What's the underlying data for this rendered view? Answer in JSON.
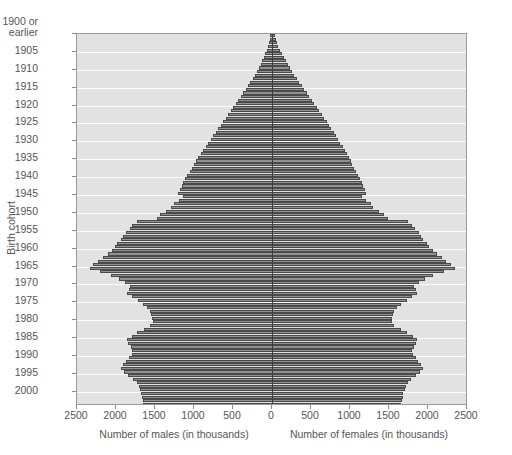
{
  "chart_data": {
    "type": "bar",
    "subtype": "population-pyramid",
    "title": "",
    "xlabel_left": "Number of males (in thousands)",
    "xlabel_right": "Number of females (in thousands)",
    "ylabel": "Birth cohort",
    "grid": true,
    "legend": "none",
    "xlim_half": [
      0,
      2500
    ],
    "x_ticks": [
      2500,
      2000,
      1500,
      1000,
      500,
      0,
      500,
      1000,
      1500,
      2000,
      2500
    ],
    "y_ticks": [
      "1900 or earlier",
      "1905",
      "1910",
      "1915",
      "1920",
      "1925",
      "1930",
      "1935",
      "1940",
      "1945",
      "1950",
      "1955",
      "1960",
      "1965",
      "1970",
      "1975",
      "1980",
      "1985",
      "1990",
      "1995",
      "2000"
    ],
    "y_first_cohort": 1900,
    "y_last_cohort": 2002,
    "units": "thousands of people",
    "colors": {
      "bar_fill": "#909090",
      "bar_edge": "#4a4a4a",
      "plot_background": "#e2e2e2",
      "gridline": "#fbfbfb",
      "center_axis": "#3b3b3b",
      "text": "#555555"
    },
    "series": [
      {
        "name": "Number of males (in thousands)",
        "side": "left",
        "values": [
          20,
          30,
          42,
          55,
          70,
          86,
          104,
          124,
          146,
          170,
          196,
          222,
          250,
          278,
          308,
          338,
          370,
          400,
          432,
          464,
          496,
          528,
          560,
          592,
          624,
          656,
          688,
          720,
          752,
          784,
          816,
          848,
          880,
          912,
          944,
          972,
          1000,
          1028,
          1056,
          1084,
          1112,
          1135,
          1158,
          1180,
          1202,
          1140,
          1190,
          1255,
          1290,
          1360,
          1430,
          1480,
          1735,
          1790,
          1825,
          1875,
          1905,
          1930,
          1985,
          2010,
          2055,
          2105,
          2170,
          2230,
          2290,
          2330,
          2200,
          2060,
          1960,
          1880,
          1815,
          1835,
          1860,
          1790,
          1720,
          1655,
          1600,
          1560,
          1545,
          1535,
          1530,
          1565,
          1645,
          1725,
          1800,
          1860,
          1845,
          1810,
          1790,
          1800,
          1835,
          1870,
          1905,
          1930,
          1895,
          1840,
          1780,
          1735,
          1710,
          1695,
          1680,
          1670,
          1660,
          1650
        ]
      },
      {
        "name": "Number of females (in thousands)",
        "side": "right",
        "values": [
          34,
          48,
          64,
          82,
          102,
          124,
          148,
          174,
          200,
          228,
          258,
          288,
          318,
          350,
          382,
          414,
          446,
          478,
          510,
          542,
          574,
          606,
          638,
          670,
          700,
          730,
          760,
          790,
          820,
          848,
          876,
          904,
          932,
          958,
          984,
          1008,
          1032,
          1056,
          1080,
          1104,
          1126,
          1148,
          1170,
          1190,
          1210,
          1150,
          1200,
          1265,
          1300,
          1370,
          1440,
          1490,
          1740,
          1795,
          1830,
          1880,
          1910,
          1935,
          1990,
          2015,
          2060,
          2110,
          2175,
          2235,
          2295,
          2340,
          2205,
          2070,
          1965,
          1885,
          1820,
          1840,
          1865,
          1795,
          1725,
          1660,
          1605,
          1565,
          1550,
          1540,
          1535,
          1570,
          1650,
          1730,
          1805,
          1865,
          1850,
          1815,
          1795,
          1805,
          1840,
          1875,
          1910,
          1935,
          1900,
          1845,
          1785,
          1740,
          1715,
          1700,
          1685,
          1675,
          1665,
          1655
        ]
      }
    ]
  },
  "axis": {
    "y_title": "Birth cohort",
    "x_title_left": "Number of males (in thousands)",
    "x_title_right": "Number of females (in thousands)"
  }
}
